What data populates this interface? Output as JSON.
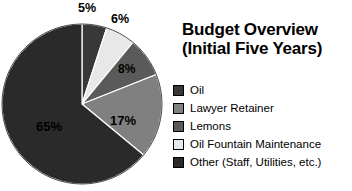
{
  "chart_data": {
    "type": "pie",
    "title": "Budget Overview\n(Initial Five Years)",
    "title_line1": "Budget Overview",
    "title_line2": "(Initial Five Years)",
    "categories": [
      "Oil",
      "Lawyer Retainer",
      "Lemons",
      "Oil Fountain Maintenance",
      "Other (Staff, Utilities, etc.)"
    ],
    "values": [
      5,
      6,
      8,
      17,
      65
    ],
    "unit": "%",
    "slices": [
      {
        "label": "Oil",
        "value": 5,
        "display": "5%",
        "color": "#383838",
        "start_deg": 0,
        "end_deg": 18,
        "label_x": 78,
        "label_y": 2,
        "label_size": 12.5
      },
      {
        "label": "Oil Fountain Maintenance",
        "value": 6,
        "display": "6%",
        "color": "#e8e8e8",
        "start_deg": 18,
        "end_deg": 39.6,
        "label_x": 111,
        "label_y": 13,
        "label_size": 12.5
      },
      {
        "label": "Lemons",
        "value": 8,
        "display": "8%",
        "color": "#5a5a5a",
        "start_deg": 39.6,
        "end_deg": 68.4,
        "label_x": 118,
        "label_y": 63,
        "label_size": 12
      },
      {
        "label": "Lawyer Retainer",
        "value": 17,
        "display": "17%",
        "color": "#808080",
        "start_deg": 68.4,
        "end_deg": 129.6,
        "label_x": 110,
        "label_y": 114,
        "label_size": 13
      },
      {
        "label": "Other (Staff, Utilities, etc.)",
        "value": 65,
        "display": "65%",
        "color": "#2a2a2a",
        "start_deg": 129.6,
        "end_deg": 360,
        "label_x": 36,
        "label_y": 120,
        "label_size": 13
      }
    ],
    "legend": [
      {
        "label": "Oil",
        "color": "#383838"
      },
      {
        "label": "Lawyer Retainer",
        "color": "#808080"
      },
      {
        "label": "Lemons",
        "color": "#5a5a5a"
      },
      {
        "label": "Oil Fountain Maintenance",
        "color": "#e8e8e8"
      },
      {
        "label": "Other (Staff, Utilities, etc.)",
        "color": "#2a2a2a"
      }
    ],
    "legend_position": "right",
    "grid": false,
    "geometry": {
      "center_x": 82,
      "center_y": 104,
      "radius": 80,
      "stroke": "#ffffff",
      "stroke_width": 1.2
    },
    "background": "#ffffff",
    "label_color": "#000000"
  }
}
